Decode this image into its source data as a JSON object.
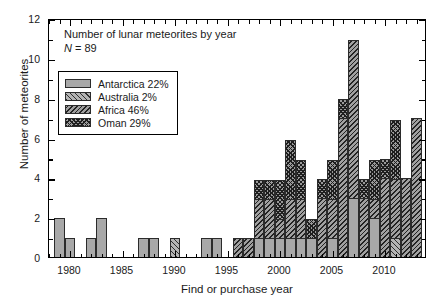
{
  "chart_data": {
    "type": "bar",
    "title": "Number of lunar meteorites by year",
    "annotation_n": "N = 89",
    "xlabel": "Find or purchase year",
    "ylabel": "Number of meteorites",
    "xlim": [
      1978,
      2014
    ],
    "ylim": [
      0,
      12
    ],
    "x_ticks": [
      1980,
      1985,
      1990,
      1995,
      2000,
      2005,
      2010
    ],
    "y_ticks": [
      0,
      2,
      4,
      6,
      8,
      10,
      12
    ],
    "x_minor_interval": 1,
    "y_minor_interval": 1,
    "grid": false,
    "stacked": true,
    "legend_position": "upper-left-inside",
    "categories": [
      1979,
      1980,
      1981,
      1982,
      1983,
      1984,
      1985,
      1986,
      1987,
      1988,
      1989,
      1990,
      1991,
      1992,
      1993,
      1994,
      1995,
      1996,
      1997,
      1998,
      1999,
      2000,
      2001,
      2002,
      2003,
      2004,
      2005,
      2006,
      2007,
      2008,
      2009,
      2010,
      2011,
      2012,
      2013
    ],
    "series": [
      {
        "name": "Antarctica",
        "label": "Antarctica 22%",
        "percent": 22,
        "pattern": "solid-gray",
        "color": "#a8a8a8",
        "values": [
          2,
          1,
          0,
          1,
          2,
          0,
          0,
          0,
          1,
          1,
          0,
          0,
          0,
          0,
          1,
          1,
          0,
          0,
          0,
          1,
          1,
          1,
          1,
          1,
          1,
          0,
          1,
          0,
          3,
          0,
          2,
          0,
          0,
          0,
          0
        ]
      },
      {
        "name": "Australia",
        "label": "Australia 2%",
        "percent": 2,
        "pattern": "forward-hatch",
        "color": "#b4b4b4",
        "values": [
          0,
          0,
          0,
          0,
          0,
          0,
          0,
          0,
          0,
          0,
          0,
          1,
          0,
          0,
          0,
          0,
          0,
          0,
          0,
          0,
          0,
          0,
          0,
          0,
          0,
          0,
          0,
          0,
          0,
          0,
          0,
          0,
          1,
          0,
          0
        ]
      },
      {
        "name": "Africa",
        "label": "Africa 46%",
        "percent": 46,
        "pattern": "back-hatch",
        "color": "#a0a0a0",
        "values": [
          0,
          0,
          0,
          0,
          0,
          0,
          0,
          0,
          0,
          0,
          0,
          0,
          0,
          0,
          0,
          0,
          0,
          1,
          1,
          2,
          2,
          1,
          2,
          2,
          0,
          3,
          2,
          7,
          8,
          3,
          1,
          4,
          3,
          4,
          7
        ]
      },
      {
        "name": "Oman",
        "label": "Oman 29%",
        "percent": 29,
        "pattern": "cross-hatch",
        "color": "#9a9a9a",
        "values": [
          0,
          0,
          0,
          0,
          0,
          0,
          0,
          0,
          0,
          0,
          0,
          0,
          0,
          0,
          0,
          0,
          0,
          0,
          0,
          1,
          1,
          2,
          3,
          2,
          1,
          1,
          2,
          1,
          0,
          1,
          2,
          1,
          3,
          0,
          0
        ]
      }
    ],
    "totals": [
      2,
      1,
      0,
      1,
      2,
      0,
      0,
      0,
      1,
      1,
      0,
      1,
      0,
      0,
      1,
      1,
      0,
      1,
      1,
      4,
      4,
      4,
      6,
      5,
      2,
      4,
      5,
      8,
      11,
      4,
      5,
      5,
      6,
      4,
      7
    ]
  }
}
